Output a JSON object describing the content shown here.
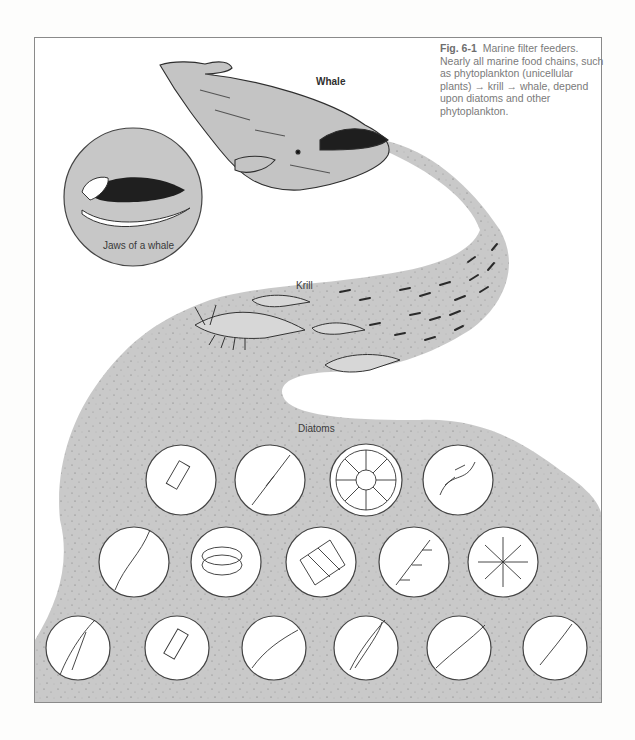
{
  "figure": {
    "number": "Fig. 6-1",
    "caption": "Marine filter feeders. Nearly all marine food chains, such as phytoplankton (unicellular plants) → krill → whale, depend upon diatoms and other phytoplankton."
  },
  "labels": {
    "whale": "Whale",
    "jaws": "Jaws of a whale",
    "krill": "Krill",
    "diatoms": "Diatoms"
  },
  "food_chain": [
    "phytoplankton (unicellular plants)",
    "krill",
    "whale"
  ],
  "diatom_rows": [
    {
      "row": 1,
      "count": 4,
      "types": [
        "bristled-cylinder",
        "needle-spindle",
        "radial-disc",
        "chain-cluster"
      ]
    },
    {
      "row": 2,
      "count": 5,
      "types": [
        "twisted-filament",
        "stacked-drum",
        "ribbon-colony",
        "spool-chain",
        "star-colony"
      ]
    },
    {
      "row": 3,
      "count": 6,
      "types": [
        "segmented-chain",
        "spined-cylinder",
        "thin-rod",
        "lens-spindle",
        "long-spindle",
        "hair-spindle"
      ]
    }
  ],
  "colors": {
    "band_fill": "#c9c9c9",
    "whale_fill": "#c4c4c4",
    "outline": "#3a3a3a",
    "frame_border": "#8a8a8a",
    "caption_text": "#7a7a7a"
  }
}
